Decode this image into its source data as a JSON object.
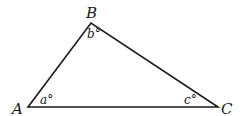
{
  "diagram": {
    "type": "triangle",
    "stroke_color": "#1a1a1a",
    "background": "#ffffff",
    "vertices": [
      {
        "name": "A",
        "x": 28,
        "y": 107
      },
      {
        "name": "B",
        "x": 91,
        "y": 23
      },
      {
        "name": "C",
        "x": 218,
        "y": 107
      }
    ],
    "vertex_labels": {
      "A": "A",
      "B": "B",
      "C": "C"
    },
    "angle_labels": {
      "a": "a°",
      "b": "b°",
      "c": "c°"
    }
  }
}
